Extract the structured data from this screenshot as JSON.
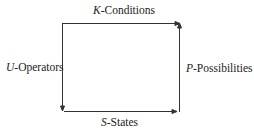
{
  "diagram": {
    "labels": {
      "top": {
        "var": "K",
        "text": "-Conditions"
      },
      "left": {
        "var": "U",
        "text": "-Operators"
      },
      "right": {
        "var": "P",
        "text": "-Possibilities"
      },
      "bottom": {
        "var": "S",
        "text": "-States"
      }
    },
    "edges": [
      {
        "side": "top",
        "direction": "right"
      },
      {
        "side": "right",
        "direction": "up"
      },
      {
        "side": "left",
        "direction": "down"
      },
      {
        "side": "bottom",
        "direction": "right"
      }
    ],
    "line_color": "#333333"
  }
}
